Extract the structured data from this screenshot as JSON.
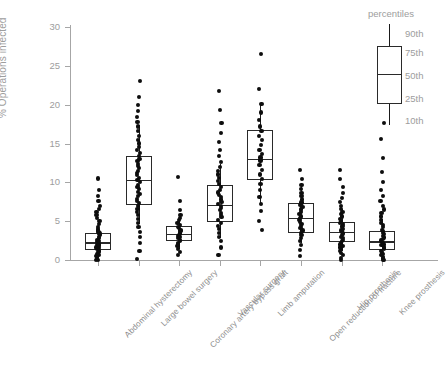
{
  "chart_data": {
    "type": "box",
    "title": "",
    "xlabel": "",
    "ylabel": "% Operations infected",
    "ylim": [
      0,
      30
    ],
    "yticks": [
      0,
      5,
      10,
      15,
      20,
      25,
      30
    ],
    "ytick_labels": [
      "0",
      "5",
      "10",
      "15",
      "20",
      "25",
      "30"
    ],
    "grid": false,
    "legend_position": "top-right",
    "categories": [
      "Abdominal hysterectomy",
      "Large bowel surgery",
      "Coronary artery bypass graft",
      "Vascular surgery",
      "Limb amputation",
      "Open reduction of fracture",
      "Hip prosthesis",
      "Knee prosthesis"
    ],
    "series": [
      {
        "name": "Abdominal hysterectomy",
        "p10": 0.3,
        "p25": 1.3,
        "p50": 2.3,
        "p75": 3.5,
        "p90": 5.2,
        "points": [
          0.0,
          0.0,
          0.3,
          0.5,
          0.6,
          0.8,
          1.0,
          1.1,
          1.2,
          1.4,
          1.5,
          1.6,
          1.8,
          1.9,
          2.0,
          2.1,
          2.2,
          2.3,
          2.4,
          2.6,
          2.8,
          3.0,
          3.2,
          3.4,
          3.6,
          3.8,
          4.0,
          4.3,
          4.6,
          5.0,
          5.4,
          5.8,
          6.2,
          6.6,
          7.0,
          7.6,
          8.2,
          9.0,
          10.5
        ]
      },
      {
        "name": "Large bowel surgery",
        "p10": 4.6,
        "p25": 7.1,
        "p50": 10.3,
        "p75": 13.4,
        "p90": 17.4,
        "points": [
          0.1,
          1.2,
          2.2,
          3.0,
          3.6,
          4.3,
          4.8,
          5.3,
          5.8,
          6.2,
          6.6,
          7.0,
          7.3,
          7.6,
          7.9,
          8.2,
          8.5,
          8.8,
          9.1,
          9.4,
          9.7,
          10.0,
          10.3,
          10.6,
          10.9,
          11.2,
          11.5,
          11.8,
          12.1,
          12.4,
          12.7,
          13.0,
          13.4,
          13.8,
          14.2,
          14.6,
          15.0,
          15.5,
          16.0,
          16.6,
          17.2,
          17.8,
          18.4,
          19.2,
          20.0,
          21.0,
          23.0
        ]
      },
      {
        "name": "Coronary artery bypass graft",
        "p10": 1.4,
        "p25": 2.5,
        "p50": 3.4,
        "p75": 4.4,
        "p90": 5.6,
        "points": [
          0.6,
          1.0,
          1.4,
          1.8,
          2.0,
          2.2,
          2.4,
          2.6,
          2.8,
          3.0,
          3.1,
          3.2,
          3.4,
          3.5,
          3.7,
          3.9,
          4.1,
          4.3,
          4.5,
          4.8,
          5.1,
          5.4,
          5.8,
          6.4,
          7.6,
          10.7
        ]
      },
      {
        "name": "Vascular surgery",
        "p10": 2.8,
        "p25": 4.9,
        "p50": 7.1,
        "p75": 9.6,
        "p90": 12.4,
        "points": [
          0.6,
          1.6,
          2.4,
          3.0,
          3.5,
          4.0,
          4.4,
          4.8,
          5.2,
          5.5,
          5.8,
          6.1,
          6.4,
          6.7,
          7.0,
          7.2,
          7.5,
          7.8,
          8.1,
          8.4,
          8.7,
          9.0,
          9.4,
          9.8,
          10.2,
          10.6,
          11.0,
          11.5,
          12.0,
          12.6,
          13.4,
          14.2,
          15.2,
          16.4,
          17.6,
          19.3,
          21.8
        ]
      },
      {
        "name": "Limb amputation",
        "p10": 7.3,
        "p25": 10.3,
        "p50": 13.0,
        "p75": 16.7,
        "p90": 20.1,
        "points": [
          3.9,
          5.0,
          6.3,
          7.2,
          8.1,
          9.0,
          9.8,
          10.4,
          11.0,
          11.6,
          12.2,
          12.8,
          13.2,
          13.6,
          14.2,
          14.8,
          15.4,
          16.0,
          16.6,
          17.2,
          18.0,
          19.0,
          20.1,
          22.0,
          26.5
        ]
      },
      {
        "name": "Open reduction of fracture",
        "p10": 2.2,
        "p25": 3.5,
        "p50": 5.4,
        "p75": 7.3,
        "p90": 9.7,
        "points": [
          0.5,
          1.3,
          1.9,
          2.4,
          2.8,
          3.2,
          3.5,
          3.8,
          4.1,
          4.4,
          4.6,
          4.9,
          5.1,
          5.4,
          5.6,
          5.9,
          6.2,
          6.5,
          6.8,
          7.1,
          7.4,
          7.8,
          8.2,
          8.6,
          9.1,
          9.7,
          10.4,
          11.6
        ]
      },
      {
        "name": "Hip prosthesis",
        "p10": 1.2,
        "p25": 2.3,
        "p50": 3.6,
        "p75": 4.9,
        "p90": 6.6,
        "points": [
          0.0,
          0.3,
          0.6,
          0.9,
          1.2,
          1.4,
          1.6,
          1.8,
          2.0,
          2.2,
          2.4,
          2.6,
          2.8,
          3.0,
          3.2,
          3.4,
          3.6,
          3.8,
          4.0,
          4.2,
          4.4,
          4.6,
          4.8,
          5.0,
          5.3,
          5.6,
          5.9,
          6.2,
          6.6,
          7.0,
          7.5,
          8.0,
          8.6,
          9.4,
          10.4,
          11.6
        ]
      },
      {
        "name": "Knee prosthesis",
        "p10": 0.3,
        "p25": 1.3,
        "p50": 2.4,
        "p75": 3.7,
        "p90": 5.3,
        "points": [
          0.0,
          0.0,
          0.2,
          0.4,
          0.6,
          0.8,
          1.0,
          1.2,
          1.4,
          1.5,
          1.7,
          1.9,
          2.0,
          2.2,
          2.3,
          2.5,
          2.7,
          2.9,
          3.1,
          3.3,
          3.5,
          3.7,
          3.9,
          4.2,
          4.5,
          4.8,
          5.2,
          5.6,
          6.0,
          6.5,
          7.0,
          7.6,
          8.2,
          9.0,
          10.0,
          11.3,
          13.1,
          15.6,
          17.6
        ]
      }
    ],
    "legend": {
      "title": "percentiles",
      "entries": [
        "90th",
        "75th",
        "50th",
        "25th",
        "10th"
      ]
    },
    "colors": {
      "box_stroke": "#2a2a2a",
      "whisker": "#1a1a1a",
      "point": "#0d0d0d",
      "axis": "#a6a6a6",
      "text": "#9d9d9d",
      "background": "#ffffff"
    }
  }
}
